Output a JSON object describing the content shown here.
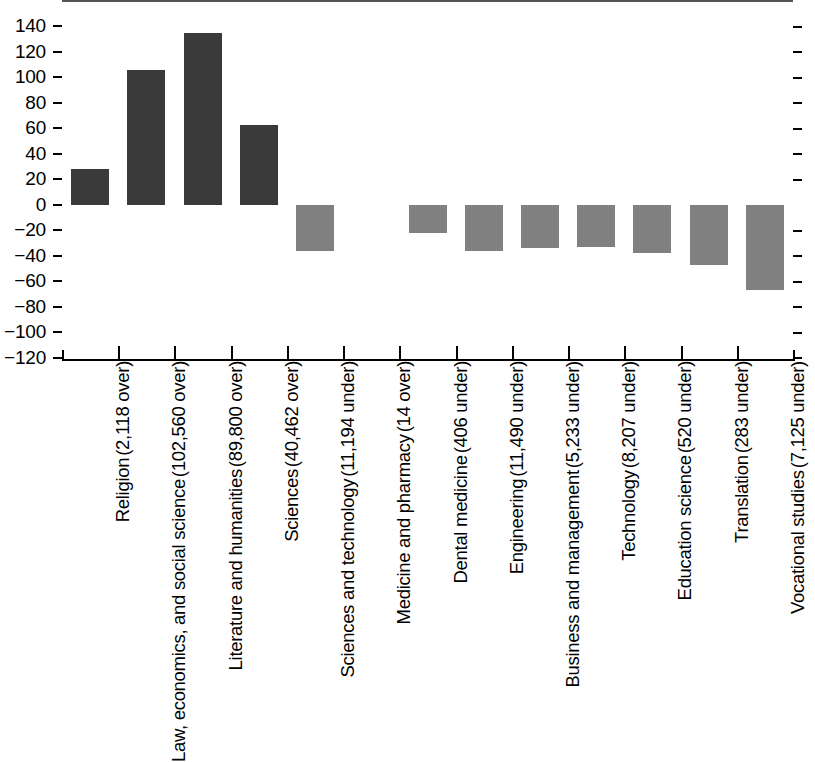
{
  "chart_data": {
    "type": "bar",
    "title": "",
    "subtitle": "",
    "xlabel": "",
    "ylabel": "",
    "ylim": [
      -120,
      140
    ],
    "ytick_step": 20,
    "grid": false,
    "legend": false,
    "orientation": "vertical",
    "baseline": 0,
    "colors": {
      "positive": "#3a3a3a",
      "negative": "#808080",
      "axis": "#000000",
      "zero_line": "#555555",
      "background": "#ffffff"
    },
    "ytick_labels": [
      "140",
      "120",
      "100",
      "80",
      "60",
      "40",
      "20",
      "0",
      "−20",
      "−40",
      "−60",
      "−80",
      "−100",
      "−120"
    ],
    "ytick_values": [
      140,
      120,
      100,
      80,
      60,
      40,
      20,
      0,
      -20,
      -40,
      -60,
      -80,
      -100,
      -120
    ],
    "categories": [
      "Religion (2,118 over)",
      "Law, economics, and social science (102,560 over)",
      "Literature and humanities (89,800 over)",
      "Sciences (40,462 over)",
      "Sciences and technology (11,194 under)",
      "Medicine and pharmacy (14 over)",
      "Dental medicine (406 under)",
      "Engineering (11,490 under)",
      "Business and management (5,233 under)",
      "Technology (8,207 under)",
      "Education science (520 under)",
      "Translation (283 under)",
      "Vocational studies (7,125 under)"
    ],
    "values": [
      28,
      106,
      135,
      63,
      -36,
      0,
      -22,
      -36,
      -34,
      -33,
      -38,
      -47,
      -67
    ],
    "points": [
      {
        "name": "Religion",
        "detail": "(2,118 over)",
        "value": 28,
        "sign": "positive",
        "count": 2118,
        "direction": "over"
      },
      {
        "name": "Law, economics, and social science",
        "detail": "(102,560 over)",
        "value": 106,
        "sign": "positive",
        "count": 102560,
        "direction": "over"
      },
      {
        "name": "Literature and humanities",
        "detail": "(89,800 over)",
        "value": 135,
        "sign": "positive",
        "count": 89800,
        "direction": "over"
      },
      {
        "name": "Sciences",
        "detail": "(40,462 over)",
        "value": 63,
        "sign": "positive",
        "count": 40462,
        "direction": "over"
      },
      {
        "name": "Sciences and technology",
        "detail": "(11,194 under)",
        "value": -36,
        "sign": "negative",
        "count": 11194,
        "direction": "under"
      },
      {
        "name": "Medicine and pharmacy",
        "detail": "(14 over)",
        "value": 0,
        "sign": "positive",
        "count": 14,
        "direction": "over"
      },
      {
        "name": "Dental medicine",
        "detail": "(406 under)",
        "value": -22,
        "sign": "negative",
        "count": 406,
        "direction": "under"
      },
      {
        "name": "Engineering",
        "detail": "(11,490 under)",
        "value": -36,
        "sign": "negative",
        "count": 11490,
        "direction": "under"
      },
      {
        "name": "Business and management",
        "detail": "(5,233 under)",
        "value": -34,
        "sign": "negative",
        "count": 5233,
        "direction": "under"
      },
      {
        "name": "Technology",
        "detail": "(8,207 under)",
        "value": -33,
        "sign": "negative",
        "count": 8207,
        "direction": "under"
      },
      {
        "name": "Education science",
        "detail": "(520 under)",
        "value": -38,
        "sign": "negative",
        "count": 520,
        "direction": "under"
      },
      {
        "name": "Translation",
        "detail": "(283 under)",
        "value": -47,
        "sign": "negative",
        "count": 283,
        "direction": "under"
      },
      {
        "name": "Vocational studies",
        "detail": "(7,125 under)",
        "value": -67,
        "sign": "negative",
        "count": 7125,
        "direction": "under"
      }
    ]
  }
}
